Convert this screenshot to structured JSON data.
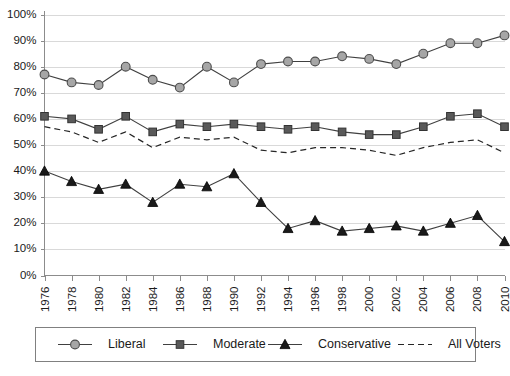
{
  "chart_data": {
    "type": "line",
    "title": "",
    "xlabel": "",
    "ylabel": "",
    "grid": true,
    "legend_position": "bottom",
    "ylim": [
      0,
      100
    ],
    "y_tick_labels": [
      "0%",
      "10%",
      "20%",
      "30%",
      "40%",
      "50%",
      "60%",
      "70%",
      "80%",
      "90%",
      "100%"
    ],
    "y_ticks": [
      0,
      10,
      20,
      30,
      40,
      50,
      60,
      70,
      80,
      90,
      100
    ],
    "categories": [
      "1976",
      "1978",
      "1980",
      "1982",
      "1984",
      "1986",
      "1988",
      "1990",
      "1992",
      "1994",
      "1996",
      "1998",
      "2000",
      "2002",
      "2004",
      "2006",
      "2008",
      "2010"
    ],
    "x": [
      1976,
      1978,
      1980,
      1982,
      1984,
      1986,
      1988,
      1990,
      1992,
      1994,
      1996,
      1998,
      2000,
      2002,
      2004,
      2006,
      2008,
      2010
    ],
    "series": [
      {
        "name": "Liberal",
        "marker": "circle",
        "style": "solid",
        "values": [
          77,
          74,
          73,
          80,
          75,
          72,
          80,
          74,
          81,
          82,
          82,
          84,
          83,
          81,
          85,
          89,
          89,
          92
        ]
      },
      {
        "name": "Moderate",
        "marker": "square",
        "style": "solid",
        "values": [
          61,
          60,
          56,
          61,
          55,
          58,
          57,
          58,
          57,
          56,
          57,
          55,
          54,
          54,
          57,
          61,
          62,
          57
        ]
      },
      {
        "name": "Conservative",
        "marker": "triangle",
        "style": "solid",
        "values": [
          40,
          36,
          33,
          35,
          28,
          35,
          34,
          39,
          28,
          18,
          21,
          17,
          18,
          19,
          17,
          20,
          23,
          13
        ]
      },
      {
        "name": "All Voters",
        "marker": "none",
        "style": "dashed",
        "values": [
          57,
          55,
          51,
          55,
          49,
          53,
          52,
          53,
          48,
          47,
          49,
          49,
          48,
          46,
          49,
          51,
          52,
          47
        ]
      }
    ]
  },
  "legend": {
    "items": [
      {
        "label": "Liberal"
      },
      {
        "label": "Moderate"
      },
      {
        "label": "Conservative"
      },
      {
        "label": "All Voters"
      }
    ]
  },
  "colors": {
    "liberal_marker": "#a6a6a6",
    "moderate_marker": "#595959",
    "conservative_marker": "#1a1a1a",
    "line": "#404040",
    "gridline": "#d9d9d9",
    "axis": "#8c8c8c"
  }
}
